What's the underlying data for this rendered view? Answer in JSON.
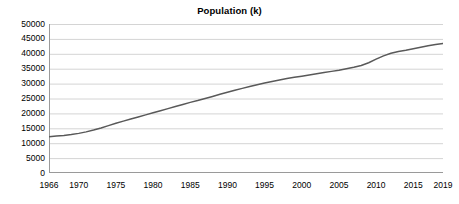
{
  "chart_data": {
    "type": "line",
    "title": "Population (k)",
    "xlabel": "",
    "ylabel": "",
    "ylim": [
      0,
      50000
    ],
    "xlim": [
      1966,
      2019
    ],
    "grid": true,
    "legend": "none",
    "y_ticks": [
      0,
      5000,
      10000,
      15000,
      20000,
      25000,
      30000,
      35000,
      40000,
      45000,
      50000
    ],
    "y_tick_labels": [
      "0",
      "5000",
      "10000",
      "15000",
      "20000",
      "25000",
      "30000",
      "35000",
      "40000",
      "45000",
      "50000"
    ],
    "x_ticks": [
      1966,
      1970,
      1975,
      1980,
      1985,
      1990,
      1995,
      2000,
      2005,
      2010,
      2015,
      2019
    ],
    "x_tick_labels": [
      "1966",
      "1970",
      "1975",
      "1980",
      "1985",
      "1990",
      "1995",
      "2000",
      "2005",
      "2010",
      "2015",
      "2019"
    ],
    "series": [
      {
        "name": "Population (k)",
        "color": "#595959",
        "x": [
          1966,
          1967,
          1968,
          1969,
          1970,
          1971,
          1972,
          1973,
          1974,
          1975,
          1976,
          1977,
          1978,
          1979,
          1980,
          1981,
          1982,
          1983,
          1984,
          1985,
          1986,
          1987,
          1988,
          1989,
          1990,
          1991,
          1992,
          1993,
          1994,
          1995,
          1996,
          1997,
          1998,
          1999,
          2000,
          2001,
          2002,
          2003,
          2004,
          2005,
          2006,
          2007,
          2008,
          2009,
          2010,
          2011,
          2012,
          2013,
          2014,
          2015,
          2016,
          2017,
          2018,
          2019
        ],
        "values": [
          12200,
          12400,
          12600,
          12900,
          13300,
          13800,
          14400,
          15100,
          15900,
          16700,
          17400,
          18100,
          18800,
          19500,
          20200,
          20900,
          21600,
          22300,
          23000,
          23700,
          24300,
          25000,
          25700,
          26400,
          27100,
          27800,
          28400,
          29000,
          29600,
          30200,
          30700,
          31200,
          31700,
          32100,
          32500,
          32900,
          33300,
          33700,
          34100,
          34500,
          35000,
          35500,
          36100,
          37000,
          38200,
          39300,
          40200,
          40800,
          41200,
          41700,
          42200,
          42700,
          43100,
          43500
        ]
      }
    ]
  }
}
